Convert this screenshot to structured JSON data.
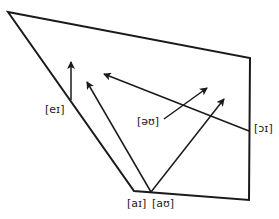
{
  "diagram": {
    "title": "",
    "type": "vowel-quadrilateral-diphthongs",
    "colors": {
      "stroke": "#1a1a1a",
      "label": "#222222",
      "background": "#ffffff"
    },
    "quadrilateral": {
      "points": [
        [
          8,
          12
        ],
        [
          250,
          58
        ],
        [
          249,
          200
        ],
        [
          134,
          191
        ]
      ]
    },
    "arrows": [
      {
        "id": "ei",
        "from": [
          71,
          100
        ],
        "to": [
          71,
          62
        ]
      },
      {
        "id": "ai",
        "from": [
          151,
          192
        ],
        "to": [
          87,
          82
        ]
      },
      {
        "id": "oi",
        "from": [
          249,
          131
        ],
        "to": [
          104,
          74
        ]
      },
      {
        "id": "ou",
        "from": [
          164,
          119
        ],
        "to": [
          207,
          88
        ]
      },
      {
        "id": "au",
        "from": [
          151,
          192
        ],
        "to": [
          224,
          99
        ]
      }
    ],
    "labels": {
      "ei": "[eɪ]",
      "ai": "[aɪ]",
      "au": "[aʊ]",
      "ou": "[əʊ]",
      "oi": "[ɔɪ]"
    }
  }
}
